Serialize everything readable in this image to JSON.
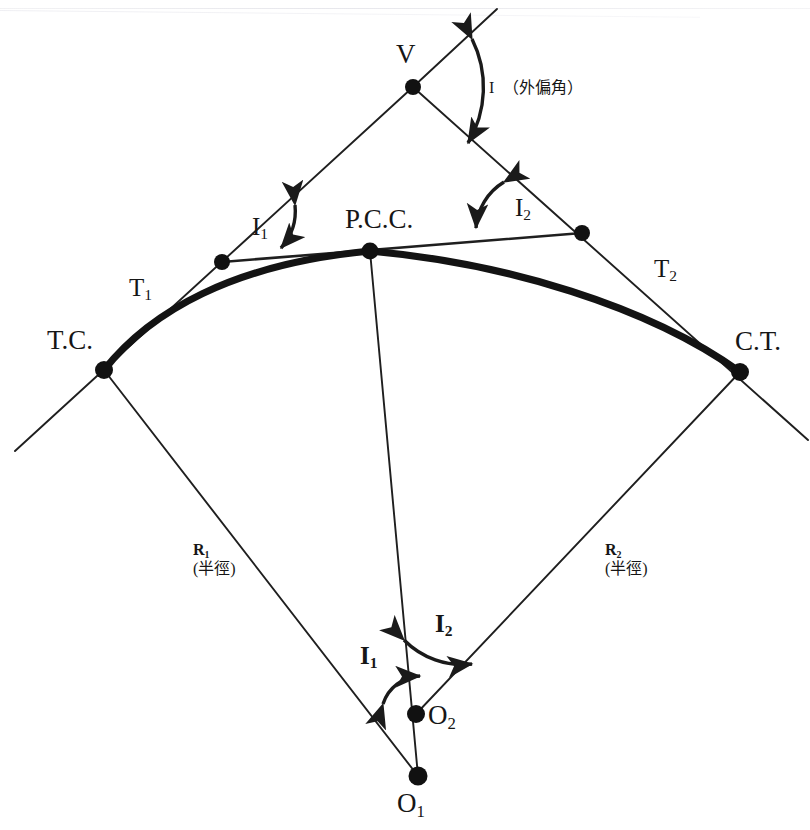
{
  "figure": {
    "type": "compound-circular-curve-diagram",
    "kind": "surveying geometry diagram",
    "background_color": "#ffffff",
    "ink_color": "#1a1a1a",
    "canvas": {
      "width": 810,
      "height": 830
    }
  },
  "scan_artifact": {
    "top_cropped_text": "",
    "note": ""
  },
  "points": [
    {
      "id": "V",
      "label": "V",
      "x": 413,
      "y": 87,
      "label_x": 396,
      "label_y": 40,
      "style": "plain"
    },
    {
      "id": "PCC",
      "label": "P.C.C.",
      "x": 370,
      "y": 251,
      "label_x": 345,
      "label_y": 207,
      "style": "plain"
    },
    {
      "id": "TC",
      "label": "T.C.",
      "x": 104,
      "y": 370,
      "label_x": 47,
      "label_y": 327,
      "style": "plain"
    },
    {
      "id": "CT",
      "label": "C.T.",
      "x": 740,
      "y": 372,
      "label_x": 735,
      "label_y": 328,
      "style": "plain"
    },
    {
      "id": "O1",
      "label": "O",
      "sub": "1",
      "x": 418,
      "y": 776,
      "label_x": 397,
      "label_y": 790,
      "style": "plain"
    },
    {
      "id": "O2",
      "label": "O",
      "sub": "2",
      "x": 416,
      "y": 714,
      "label_x": 428,
      "label_y": 702,
      "style": "plain"
    },
    {
      "id": "tanL",
      "label": "",
      "x": 222,
      "y": 262,
      "style": "plain"
    },
    {
      "id": "tanR",
      "label": "",
      "x": 582,
      "y": 233,
      "style": "plain"
    }
  ],
  "labels": {
    "deflection_angle": {
      "text": "I",
      "note": "（外偏角）",
      "x": 489,
      "y": 82
    },
    "I1_upper": {
      "text": "I",
      "sub": "1",
      "x": 252,
      "y": 216
    },
    "I2_upper": {
      "text": "I",
      "sub": "2",
      "x": 515,
      "y": 197
    },
    "T1": {
      "text": "T",
      "sub": "1",
      "x": 129,
      "y": 277
    },
    "T2": {
      "text": "T",
      "sub": "2",
      "x": 654,
      "y": 258
    },
    "R1": {
      "text": "R",
      "sub": "1",
      "note": "(半徑)",
      "x": 193,
      "y": 544
    },
    "R2": {
      "text": "R",
      "sub": "2",
      "note": "(半徑)",
      "x": 605,
      "y": 544
    },
    "I1_lower": {
      "text": "I",
      "sub": "1",
      "x": 360,
      "y": 645
    },
    "I2_lower": {
      "text": "I",
      "sub": "2",
      "x": 435,
      "y": 613
    }
  },
  "geometry": {
    "tangent_back": {
      "from": [
        15,
        451
      ],
      "to": [
        413,
        87
      ],
      "desc": "back tangent through T.C. and V"
    },
    "tangent_forward": {
      "from": [
        413,
        87
      ],
      "to": [
        810,
        438
      ],
      "desc": "forward tangent through V and C.T."
    },
    "common_tangent": {
      "from": [
        222,
        262
      ],
      "to": [
        582,
        233
      ],
      "desc": "common tangent at P.C.C."
    },
    "radius_1": {
      "from": [
        104,
        370
      ],
      "to": [
        418,
        776
      ],
      "desc": "R1 from T.C. to O1"
    },
    "radius_2": {
      "from": [
        740,
        372
      ],
      "to": [
        416,
        714
      ],
      "desc": "R2 from C.T. to O2"
    },
    "radius_pcc": {
      "from": [
        370,
        251
      ],
      "to": [
        418,
        776
      ],
      "desc": "radius line through P.C.C. to O1"
    },
    "curve_1": {
      "start": [
        104,
        370
      ],
      "end": [
        370,
        251
      ],
      "desc": "first arc T.C. to P.C.C."
    },
    "curve_2": {
      "start": [
        370,
        251
      ],
      "end": [
        740,
        372
      ],
      "desc": "second arc P.C.C. to C.T."
    },
    "arc_I": {
      "center": [
        413,
        87
      ],
      "radius": 110,
      "desc": "deflection angle arc at V"
    },
    "arc_I1": {
      "center": [
        222,
        262
      ],
      "radius": 62,
      "desc": "angle arc at first tangent point"
    },
    "arc_I2": {
      "center": [
        582,
        233
      ],
      "radius": 62,
      "desc": "angle arc at second tangent point"
    },
    "arc_I1_low": {
      "center": [
        416,
        714
      ],
      "radius": 58,
      "desc": "central angle I1 at O2 region"
    },
    "arc_I2_low": {
      "center": [
        416,
        714
      ],
      "radius": 108,
      "desc": "central angle I2 at O2"
    }
  }
}
